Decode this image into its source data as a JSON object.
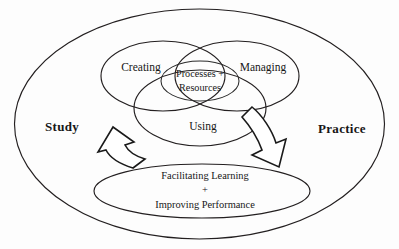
{
  "diagram": {
    "outer_container": {
      "left_label": "Study",
      "right_label": "Practice"
    },
    "venn": {
      "lobes": [
        {
          "id": "creating",
          "label": "Creating"
        },
        {
          "id": "managing",
          "label": "Managing"
        },
        {
          "id": "using",
          "label": "Using"
        }
      ],
      "center": {
        "line1": "Processes +",
        "line2": "Resources"
      }
    },
    "outcome": {
      "line1": "Facilitating Learning",
      "line2": "+",
      "line3": "Improving Performance"
    },
    "arrows": [
      {
        "id": "arrow-up-left",
        "direction": "up",
        "meaning": "outcome-to-processes"
      },
      {
        "id": "arrow-down-right",
        "direction": "down",
        "meaning": "processes-to-outcome"
      }
    ],
    "colors": {
      "stroke": "#231f20",
      "text": "#171717",
      "background": "#ffffff"
    }
  }
}
